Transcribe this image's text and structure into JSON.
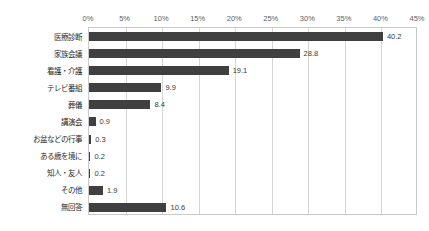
{
  "watermark": "",
  "chart_data": {
    "type": "bar",
    "orientation": "horizontal",
    "title": "",
    "subtitle": "",
    "xlabel": "",
    "ylabel": "",
    "xlim": [
      0,
      45
    ],
    "grid": true,
    "legend": false,
    "bar_color": "#404040",
    "categories": [
      "医療診断",
      "家族会議",
      "看護・介護",
      "テレビ番組",
      "葬儀",
      "講演会",
      "お盆などの行事",
      "ある歳を境に",
      "知人・友人",
      "その他",
      "無回答"
    ],
    "values": [
      40.2,
      28.8,
      19.1,
      9.9,
      8.4,
      0.9,
      0.3,
      0.2,
      0.2,
      1.9,
      10.6
    ],
    "value_labels": [
      "40.2",
      "28.8",
      "19.1",
      "9.9",
      "8.4",
      "0.9",
      "0.3",
      "0.2",
      "0.2",
      "1.9",
      "10.6"
    ],
    "xticks": [
      0,
      5,
      10,
      15,
      20,
      25,
      30,
      35,
      40,
      45
    ],
    "xtick_labels": [
      "0%",
      "5%",
      "10%",
      "15%",
      "20%",
      "25%",
      "30%",
      "35%",
      "40%",
      "45%"
    ]
  }
}
